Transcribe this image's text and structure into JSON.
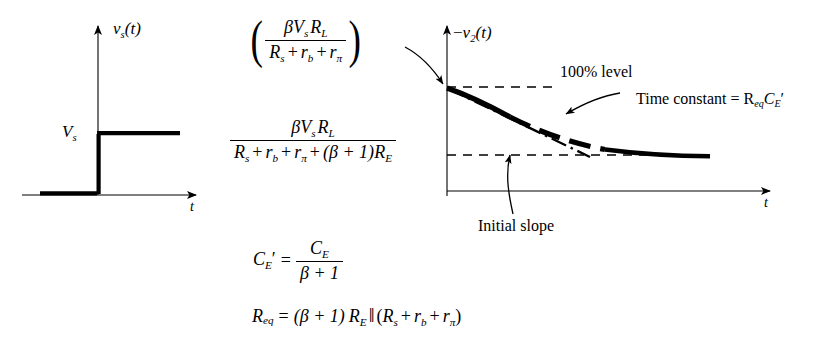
{
  "figure": {
    "background": "#ffffff",
    "ink": "#000000"
  },
  "left_plot": {
    "name": "source-step-waveform",
    "y_axis_label": "v_s(t)",
    "x_axis_label": "t",
    "step_level_label": "V_s",
    "waveform": {
      "type": "unit-step",
      "pre_step_value": 0,
      "post_step_value": "V_s",
      "step_time": 0
    }
  },
  "right_plot": {
    "name": "output-decay-waveform",
    "y_axis_label": "-v_2(t)",
    "x_axis_label": "t",
    "initial_value_label": "100% level",
    "annotations": {
      "time_constant": "Time constant = R",
      "time_constant_sub": "eq",
      "time_constant_tail": "C",
      "time_constant_tail_sub": "E",
      "time_constant_prime": "′",
      "initial_slope": "Initial  slope"
    },
    "curve": {
      "type": "exponential-decay",
      "start_value": "100%",
      "final_value": "final level",
      "tangent": "initial-slope-dash-dot"
    }
  },
  "formulas": {
    "initial_amplitude": {
      "label": "initial-amplitude-formula",
      "open_paren": "(",
      "close_paren": ")",
      "numerator_beta": "β",
      "numerator_v": "V",
      "numerator_v_sub": "s",
      "numerator_r": "R",
      "numerator_r_sub": "L",
      "den_r1": "R",
      "den_r1_sub": "s",
      "den_plus1": "+",
      "den_r2": "r",
      "den_r2_sub": "b",
      "den_plus2": "+",
      "den_r3": "r",
      "den_r3_sub": "π"
    },
    "final_amplitude": {
      "label": "final-amplitude-formula",
      "numerator_beta": "β",
      "numerator_v": "V",
      "numerator_v_sub": "s",
      "numerator_r": "R",
      "numerator_r_sub": "L",
      "den_r1": "R",
      "den_r1_sub": "s",
      "den_plus1": "+",
      "den_r2": "r",
      "den_r2_sub": "b",
      "den_plus2": "+",
      "den_r3": "r",
      "den_r3_sub": "π",
      "den_plus3": "+",
      "den_group": "(β + 1)",
      "den_re": "R",
      "den_re_sub": "E"
    },
    "ce_prime": {
      "label": "ce-prime-equation",
      "lhs_c": "C",
      "lhs_sub": "E",
      "lhs_prime": "′",
      "equals": "=",
      "num_c": "C",
      "num_sub": "E",
      "den": "β + 1"
    },
    "req": {
      "label": "req-equation",
      "lhs_r": "R",
      "lhs_sub": "eq",
      "equals": "=",
      "factor": "(β + 1)",
      "re": "R",
      "re_sub": "E",
      "parallel": "‖",
      "open": "(",
      "r1": "R",
      "r1_sub": "s",
      "plus1": "+",
      "r2": "r",
      "r2_sub": "b",
      "plus2": "+",
      "r3": "r",
      "r3_sub": "π",
      "close": ")"
    }
  }
}
